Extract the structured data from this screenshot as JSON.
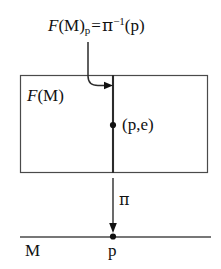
{
  "diagram": {
    "colors": {
      "stroke": "#3a3a3a",
      "fiber_stroke": "#2b2b2b",
      "text": "#111111",
      "background": "#ffffff"
    },
    "top_formula": {
      "total": "F(M)",
      "fiber_symbol": "F",
      "base_symbol": "(M)",
      "subscript": "p",
      "equals": "=",
      "map_symbol": "π",
      "exponent": "−1",
      "argument": "(p)",
      "full_text": "F(M)p = π−1(p)"
    },
    "total_space_label": {
      "italic_part": "F",
      "upright_part": "(M)",
      "full_text": "F(M)"
    },
    "point_label": "(p,e)",
    "projection_label": "π",
    "base_label": "M",
    "base_point_label": "p",
    "annotations": {
      "leader_arrow": "curved-leader-to-fiber",
      "projection_arrow": "downward-arrow",
      "fiber_line": "vertical-fiber-over-p",
      "total_space_rect": "rectangle-total-space",
      "base_line": "horizontal-base-manifold",
      "fiber_point_dot": "dot-on-fiber",
      "base_point_dot": "dot-on-base-line"
    },
    "geometry": {
      "rect": {
        "x": 20,
        "y": 75,
        "width": 188,
        "height": 98
      },
      "fiber_x": 113,
      "base_line_y": 237,
      "base_line_x1": 20,
      "base_line_x2": 211,
      "fiber_dot_y": 125,
      "projection_arrow_y1": 178,
      "projection_arrow_y2": 232
    }
  }
}
